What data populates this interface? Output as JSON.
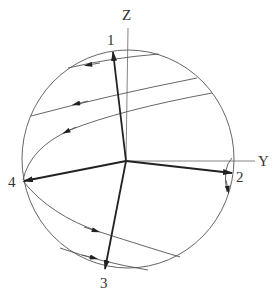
{
  "diagram": {
    "type": "sphere-vector-diagram",
    "axes": [
      {
        "name": "Z",
        "label": "Z"
      },
      {
        "name": "Y",
        "label": "Y"
      }
    ],
    "vectors": [
      {
        "id": "1",
        "label": "1"
      },
      {
        "id": "2",
        "label": "2"
      },
      {
        "id": "3",
        "label": "3"
      },
      {
        "id": "4",
        "label": "4"
      }
    ],
    "trajectories": [
      {
        "id": "upper-chord",
        "direction": "leftward"
      },
      {
        "id": "middle-chord",
        "direction": "leftward"
      },
      {
        "id": "lower-upper-curve-to-4",
        "direction": "toward point 4"
      },
      {
        "id": "curve-from-4-downward",
        "direction": "rightward"
      },
      {
        "id": "bottom-chord",
        "direction": "rightward"
      },
      {
        "id": "small-arc-near-2",
        "direction": "downward"
      }
    ],
    "colors": {
      "line": "#222222",
      "background": "#ffffff"
    }
  }
}
